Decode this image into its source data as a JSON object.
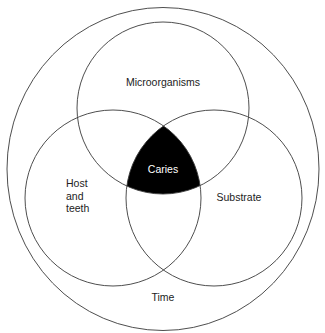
{
  "diagram": {
    "type": "venn",
    "outer_label": "Time",
    "circles": [
      {
        "id": "microorganisms",
        "label": "Microorganisms"
      },
      {
        "id": "host",
        "label_lines": [
          "Host",
          "and",
          "teeth"
        ]
      },
      {
        "id": "substrate",
        "label": "Substrate"
      }
    ],
    "intersection_label": "Caries",
    "colors": {
      "stroke": "#3a3a3a",
      "intersection_fill": "#000000",
      "background": "#ffffff"
    }
  }
}
